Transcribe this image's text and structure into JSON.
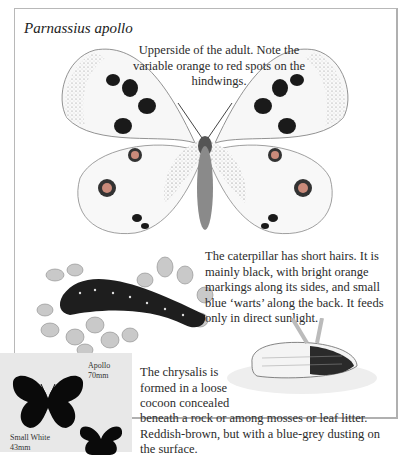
{
  "page": {
    "title": "Parnassius apollo",
    "captions": {
      "adult": "Upperside of the adult. Note the variable orange to red spots on the hindwings.",
      "caterpillar": "The caterpillar has short hairs. It is mainly black, with bright orange markings along its sides, and small blue ‘warts’ along the back. It feeds only in direct sunlight.",
      "chrysalis_part1": "The chrysalis is formed in a loose cocoon concealed",
      "chrysalis_part2": "beneath a rock or among mosses or leaf litter. Reddish-brown, but with a blue-grey dusting on the surface."
    },
    "illustrations": [
      "adult-butterfly-illustration",
      "caterpillar-illustration",
      "chrysalis-illustration"
    ]
  },
  "size_comparison": {
    "species": [
      {
        "name": "Apollo",
        "size": "70mm"
      },
      {
        "name": "Small White",
        "size": "43mm"
      }
    ]
  }
}
